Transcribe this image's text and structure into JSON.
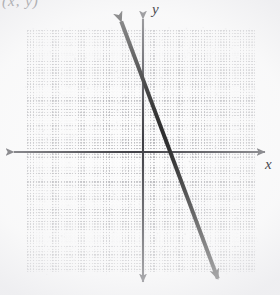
{
  "page": {
    "width": 280,
    "height": 295,
    "background_color": "#fdfdfd",
    "header_fragment_text": "(x, y)"
  },
  "chart_data": {
    "type": "line",
    "title": "",
    "xlabel": "x",
    "ylabel": "y",
    "grid": true,
    "grid_style": "dotted",
    "legend": "none",
    "xlim": [
      -4.5,
      4.5
    ],
    "ylim": [
      -5,
      5
    ],
    "x_tick_step": 1,
    "y_tick_step": 1,
    "origin_px": {
      "x": 143,
      "y": 152
    },
    "unit_px": {
      "x": 25.4,
      "y": 24.2
    },
    "series": [
      {
        "name": "line",
        "slope": -5,
        "y_intercept": 3.4,
        "x_intercept": 0.68,
        "arrow_both_ends": true,
        "color": "#171717",
        "stroke_width_px": 4,
        "points": [
          {
            "x": -1.0,
            "y": 8.4
          },
          {
            "x": 0.68,
            "y": 0.0
          },
          {
            "x": 2.1,
            "y": -7.1
          }
        ],
        "endpoints_px": [
          {
            "x": 118,
            "y": 13
          },
          {
            "x": 221,
            "y": 287
          }
        ]
      }
    ],
    "axes": {
      "x_axis": {
        "y_px": 152,
        "from_px": 6,
        "to_px": 273,
        "arrow_both_ends": true,
        "color": "#3a3a40",
        "label": "x"
      },
      "y_axis": {
        "x_px": 143,
        "from_px": 11,
        "to_px": 290,
        "arrow_both_ends": true,
        "color": "#3a3a40",
        "label": "y"
      }
    },
    "grid_box_px": {
      "left": 27,
      "top": 30,
      "width": 228,
      "height": 242
    },
    "colors": {
      "line": "#171717",
      "axis": "#3a3a40",
      "grid": "#787880",
      "label": "#4a4a50",
      "paper": "#fdfdfd"
    }
  },
  "icons": {
    "arrow_left": "arrow-left-icon",
    "arrow_right": "arrow-right-icon",
    "arrow_up": "arrow-up-icon",
    "arrow_down": "arrow-down-icon"
  }
}
